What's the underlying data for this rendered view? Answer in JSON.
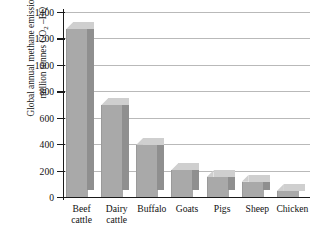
{
  "chart_data": {
    "type": "bar",
    "title": "",
    "subtitle": "",
    "categories": [
      "Beef cattle",
      "Dairy cattle",
      "Buffalo",
      "Goats",
      "Pigs",
      "Sheep",
      "Chicken"
    ],
    "category_lines": [
      [
        "Beef",
        "cattle"
      ],
      [
        "Dairy",
        "cattle"
      ],
      [
        "Buffalo"
      ],
      [
        "Goats"
      ],
      [
        "Pigs"
      ],
      [
        "Sheep"
      ],
      [
        "Chicken"
      ]
    ],
    "values": [
      1270,
      695,
      395,
      205,
      150,
      115,
      45
    ],
    "xlabel": "",
    "ylabel": "Global annual methane emissions/ million tonnes CO2 –EQ",
    "ylabel_line1": "Global annual methane emissions/",
    "ylabel_line2_pre": "million tonnes CO",
    "ylabel_line2_sub": "2",
    "ylabel_line2_post": " –EQ",
    "ylim": [
      0,
      1400
    ],
    "yticks": [
      0,
      200,
      400,
      600,
      800,
      1000,
      1200,
      1400
    ],
    "ytick_labels": [
      "0",
      "200",
      "400",
      "600",
      "800",
      "1000",
      "1200",
      "1400"
    ],
    "grid": true,
    "legend": "none",
    "style": "3d-columns",
    "bar_color": "#a9a9a9",
    "bar_side_color": "#8f8f8f",
    "bar_top_color": "#cfcfcf",
    "grid_color": "#b9b9b9",
    "axis_color": "#1a1a1a"
  }
}
